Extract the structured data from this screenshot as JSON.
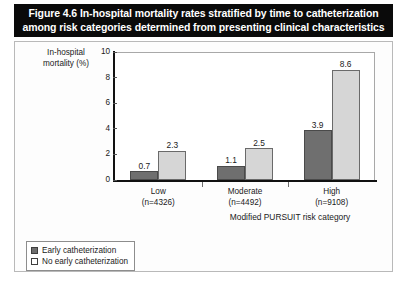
{
  "figure": {
    "title_lines": [
      "Figure 4.6 In-hospital mortality rates stratified by time to catheterization",
      "among risk categories determined from presenting clinical characteristics"
    ]
  },
  "chart_data": {
    "type": "bar",
    "title": "Figure 4.6 In-hospital mortality rates stratified by time to catheterization among risk categories determined from presenting clinical characteristics",
    "xlabel": "Modified PURSUIT risk category",
    "ylabel": "In-hospital mortality (%)",
    "ylabel_line1": "In-hospital",
    "ylabel_line2": "mortality (%)",
    "ylim": [
      0,
      10
    ],
    "yticks": [
      0,
      2,
      4,
      6,
      8,
      10
    ],
    "ytick_labels": [
      "0",
      "2",
      "4",
      "6",
      "8",
      "10"
    ],
    "grid": false,
    "legend_position": "below-left",
    "categories": [
      "Low",
      "Moderate",
      "High"
    ],
    "category_sublabels": [
      "(n=4326)",
      "(n=4492)",
      "(n=9108)"
    ],
    "series": [
      {
        "name": "Early catheterization",
        "color": "#6f6f6f",
        "values": [
          0.7,
          1.1,
          3.9
        ],
        "value_labels": [
          "0.7",
          "1.1",
          "3.9"
        ]
      },
      {
        "name": "No early catheterization",
        "color": "#d6d6d6",
        "values": [
          2.3,
          2.5,
          8.6
        ],
        "value_labels": [
          "2.3",
          "2.5",
          "8.6"
        ]
      }
    ]
  },
  "legend": {
    "items": [
      {
        "label": "Early catheterization",
        "swatch": "dark"
      },
      {
        "label": "No early catheterization",
        "swatch": "light"
      }
    ]
  }
}
